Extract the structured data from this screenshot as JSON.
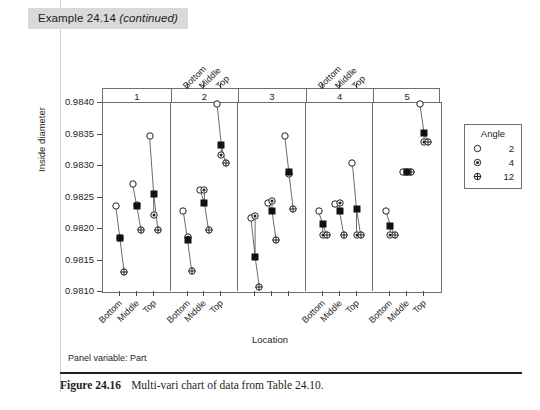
{
  "header": {
    "example_label": "Example 24.14",
    "continued_label": "(continued)"
  },
  "caption": {
    "figure_number": "Figure 24.16",
    "text": "Multi-vari chart of data from Table 24.10."
  },
  "legend": {
    "title": "Angle",
    "entries": [
      {
        "label": "2",
        "marker": "open-circle-icon"
      },
      {
        "label": "4",
        "marker": "dot-circle-icon"
      },
      {
        "label": "12",
        "marker": "crosshair-circle-icon"
      }
    ]
  },
  "panel_variable_text": "Panel variable: Part",
  "chart_data": {
    "type": "scatter",
    "title": "",
    "xlabel": "Location",
    "ylabel": "Inside diameter",
    "ylim": [
      0.981,
      0.984
    ],
    "yticks": [
      "0.9810",
      "0.9815",
      "0.9820",
      "0.9825",
      "0.9830",
      "0.9835",
      "0.9840"
    ],
    "ytick_values": [
      0.981,
      0.9815,
      0.982,
      0.9825,
      0.983,
      0.9835,
      0.984
    ],
    "grid": false,
    "legend_position": "right",
    "panel_variable": "Part",
    "panel_labels": [
      "1",
      "2",
      "3",
      "4",
      "5"
    ],
    "x_categories": [
      "Bottom",
      "Middle",
      "Top"
    ],
    "series": [
      {
        "name": "2",
        "marker": "open-circle-icon"
      },
      {
        "name": "4",
        "marker": "dot-circle-icon"
      },
      {
        "name": "12",
        "marker": "crosshair-circle-icon"
      },
      {
        "name": "mean",
        "marker": "filled-square-icon"
      }
    ],
    "panels": [
      {
        "panel": "1",
        "groups": [
          {
            "location": "Bottom",
            "angle_2": 0.98237,
            "angle_4": 0.98185,
            "angle_12": 0.98132,
            "mean": 0.98185
          },
          {
            "location": "Middle",
            "angle_2": 0.98271,
            "angle_4": 0.98238,
            "angle_12": 0.98198,
            "mean": 0.98236
          },
          {
            "location": "Top",
            "angle_2": 0.98348,
            "angle_4": 0.98222,
            "angle_12": 0.98198,
            "mean": 0.98256
          }
        ]
      },
      {
        "panel": "2",
        "groups": [
          {
            "location": "Bottom",
            "angle_2": 0.98228,
            "angle_4": 0.98187,
            "angle_12": 0.98133,
            "mean": 0.98183
          },
          {
            "location": "Middle",
            "angle_2": 0.98262,
            "angle_4": 0.98262,
            "angle_12": 0.98198,
            "mean": 0.98241
          },
          {
            "location": "Top",
            "angle_2": 0.98398,
            "angle_4": 0.98318,
            "angle_12": 0.98305,
            "mean": 0.98333
          }
        ]
      },
      {
        "panel": "3",
        "groups": [
          {
            "location": "Bottom",
            "angle_2": 0.98218,
            "angle_4": 0.9822,
            "angle_12": 0.98108,
            "mean": 0.98156
          },
          {
            "location": "Middle",
            "angle_2": 0.98242,
            "angle_4": 0.98245,
            "angle_12": 0.98182,
            "mean": 0.98228
          },
          {
            "location": "Top",
            "angle_2": 0.98348,
            "angle_4": 0.98288,
            "angle_12": 0.98232,
            "mean": 0.9829
          }
        ]
      },
      {
        "panel": "4",
        "groups": [
          {
            "location": "Bottom",
            "angle_2": 0.98228,
            "angle_4": 0.9819,
            "angle_12": 0.9819,
            "mean": 0.98208
          },
          {
            "location": "Middle",
            "angle_2": 0.9824,
            "angle_4": 0.98242,
            "angle_12": 0.9819,
            "mean": 0.98228
          },
          {
            "location": "Top",
            "angle_2": 0.98305,
            "angle_4": 0.9819,
            "angle_12": 0.9819,
            "mean": 0.98232
          }
        ]
      },
      {
        "panel": "5",
        "groups": [
          {
            "location": "Bottom",
            "angle_2": 0.98228,
            "angle_4": 0.9819,
            "angle_12": 0.9819,
            "mean": 0.98205
          },
          {
            "location": "Middle",
            "angle_2": 0.9829,
            "angle_4": 0.9829,
            "angle_12": 0.9829,
            "mean": 0.9829
          },
          {
            "location": "Top",
            "angle_2": 0.98398,
            "angle_4": 0.98338,
            "angle_12": 0.98338,
            "mean": 0.98352
          }
        ]
      }
    ]
  }
}
